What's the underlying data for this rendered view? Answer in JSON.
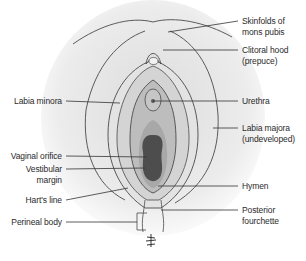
{
  "figure": {
    "type": "anatomical-labeled-diagram",
    "colors": {
      "skin": "#ececec",
      "outline": "#4a4a4a",
      "labia_minora": "#d9d9d9",
      "vestibule": "#bdbdbd",
      "inner_vestibule": "#a8a8a8",
      "orifice": "#4d4d4d",
      "leader_line": "#333333",
      "text": "#2a2a2a"
    }
  },
  "labels": {
    "left": [
      {
        "id": "labia-minora",
        "lines": [
          "Labia minora"
        ]
      },
      {
        "id": "vaginal-orifice",
        "lines": [
          "Vaginal orifice"
        ]
      },
      {
        "id": "vestibular-margin",
        "lines": [
          "Vestibular",
          "margin"
        ]
      },
      {
        "id": "harts-line",
        "lines": [
          "Hart's line"
        ]
      },
      {
        "id": "perineal-body",
        "lines": [
          "Perineal body"
        ]
      }
    ],
    "right": [
      {
        "id": "skinfolds-mons-pubis",
        "lines": [
          "Skinfolds of",
          "mons pubis"
        ]
      },
      {
        "id": "clitoral-hood",
        "lines": [
          "Clitoral hood",
          "(prepuce)"
        ]
      },
      {
        "id": "urethra",
        "lines": [
          "Urethra"
        ]
      },
      {
        "id": "labia-majora",
        "lines": [
          "Labia majora",
          "(undeveloped)"
        ]
      },
      {
        "id": "hymen",
        "lines": [
          "Hymen"
        ]
      },
      {
        "id": "posterior-fourchette",
        "lines": [
          "Posterior",
          "fourchette"
        ]
      }
    ]
  }
}
